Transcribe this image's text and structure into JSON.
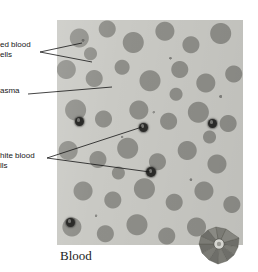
{
  "figure": {
    "caption": "Blood",
    "plate": {
      "x": 57,
      "y": 20,
      "width": 186,
      "height": 225,
      "background_color": "#c9c9c4",
      "cell_clump_color": "#8e8e89",
      "white_cell_color": "#2b2b29"
    }
  },
  "labels": [
    {
      "id": "red-blood-cells",
      "line1": "ed blood",
      "line2": "ells",
      "full_text": "Red blood cells",
      "x": 0,
      "y": 40,
      "leaders": 2
    },
    {
      "id": "plasma",
      "line1": "asma",
      "line2": "",
      "full_text": "Plasma",
      "x": 0,
      "y": 86,
      "leaders": 1
    },
    {
      "id": "white-blood-cells",
      "line1": "hite blood",
      "line2": "lls",
      "full_text": "White blood cells",
      "x": 0,
      "y": 151,
      "leaders": 2
    }
  ],
  "leader_lines": [
    {
      "name": "red-blood-cells-leader-1",
      "x1": 40,
      "y1": 52,
      "x2": 82,
      "y2": 43
    },
    {
      "name": "red-blood-cells-leader-2",
      "x1": 40,
      "y1": 52,
      "x2": 92,
      "y2": 62
    },
    {
      "name": "plasma-leader-1",
      "x1": 28,
      "y1": 94,
      "x2": 112,
      "y2": 87
    },
    {
      "name": "white-blood-cells-leader-1",
      "x1": 47,
      "y1": 158,
      "x2": 142,
      "y2": 127
    },
    {
      "name": "white-blood-cells-leader-2",
      "x1": 47,
      "y1": 158,
      "x2": 150,
      "y2": 172
    }
  ],
  "white_blood_cells": [
    {
      "name": "white-blood-cell-upper-left",
      "cx": 79,
      "cy": 121,
      "r": 4.5
    },
    {
      "name": "white-blood-cell-center",
      "cx": 143,
      "cy": 127,
      "r": 4.5
    },
    {
      "name": "white-blood-cell-lower-center",
      "cx": 151,
      "cy": 172,
      "r": 5.0
    },
    {
      "name": "white-blood-cell-right",
      "cx": 212,
      "cy": 123,
      "r": 4.5
    },
    {
      "name": "white-blood-cell-lower-left",
      "cx": 70,
      "cy": 222,
      "r": 4.5
    }
  ],
  "scale_object": {
    "name": "pinwheel-diatom",
    "description": "radiating fan-shaped object at lower right of plate",
    "x": 196,
    "y": 222,
    "width": 46,
    "height": 44,
    "color": "#6e6e69"
  }
}
